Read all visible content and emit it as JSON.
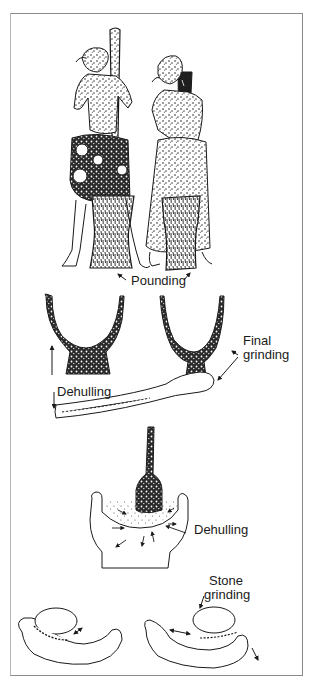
{
  "figure": {
    "labels": {
      "pounding": "Pounding",
      "dehulling_1": "Dehulling",
      "final_grinding_line1": "Final",
      "final_grinding_line2": "grinding",
      "dehulling_2": "Dehulling",
      "stone_grinding_line1": "Stone",
      "stone_grinding_line2": "grinding"
    },
    "panels": [
      {
        "name": "women-pounding",
        "caption_key": "pounding"
      },
      {
        "name": "mortar-cross-sections-and-pestle",
        "caption_keys": [
          "dehulling_1",
          "final_grinding_line1",
          "final_grinding_line2"
        ]
      },
      {
        "name": "mortar-dehulling-detail",
        "caption_key": "dehulling_2"
      },
      {
        "name": "saddle-quern-stone-grinding",
        "caption_keys": [
          "stone_grinding_line1",
          "stone_grinding_line2"
        ]
      }
    ],
    "colors": {
      "ink": "#1a1a1a",
      "frame": "#8a8a8a",
      "background": "#ffffff"
    }
  }
}
